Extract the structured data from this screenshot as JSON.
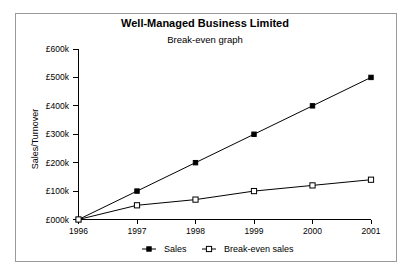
{
  "chart_data": {
    "type": "line",
    "title": "Well-Managed Business Limited",
    "subtitle": "Break-even graph",
    "xlabel": "",
    "ylabel": "Sales/Turnover",
    "categories": [
      "1996",
      "1997",
      "1998",
      "1999",
      "2000",
      "2001"
    ],
    "x": [
      1996,
      1997,
      1998,
      1999,
      2000,
      2001
    ],
    "series": [
      {
        "name": "Sales",
        "marker": "filled-square",
        "values": [
          0,
          100000,
          200000,
          300000,
          400000,
          500000
        ]
      },
      {
        "name": "Break-even sales",
        "marker": "open-square",
        "values": [
          0,
          50000,
          70000,
          100000,
          120000,
          140000
        ]
      }
    ],
    "ylim": [
      0,
      600000
    ],
    "ytick_values": [
      0,
      100000,
      200000,
      300000,
      400000,
      500000,
      600000
    ],
    "ytick_labels": [
      "£000k",
      "£100k",
      "£200k",
      "£300k",
      "£400k",
      "£500k",
      "£600k"
    ],
    "xtick_labels": [
      "1996",
      "1997",
      "1998",
      "1999",
      "2000",
      "2001"
    ],
    "grid": false,
    "legend_position": "bottom",
    "legend_entries": [
      "Sales",
      "Break-even sales"
    ],
    "colors": {
      "line": "#000000",
      "text": "#000000",
      "frame": "#9a9a9a",
      "background": "#ffffff"
    }
  }
}
